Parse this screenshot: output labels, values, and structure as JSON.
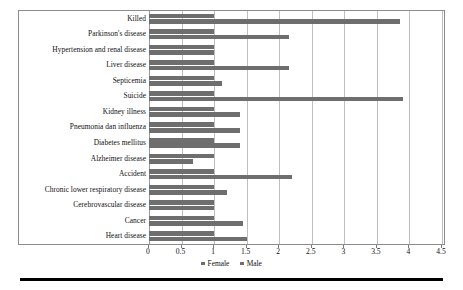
{
  "chart_data": {
    "type": "bar",
    "orientation": "horizontal",
    "title": "",
    "subtitle": "",
    "xlabel": "",
    "ylabel": "",
    "xlim": [
      0,
      4.5
    ],
    "ylim": null,
    "grid": true,
    "grid_axis": "x",
    "legend": {
      "position": "bottom-center",
      "entries": [
        {
          "name": "Female",
          "color": "#6e6e6e"
        },
        {
          "name": "Male",
          "color": "#6e6e6e"
        }
      ]
    },
    "xticks": [
      0,
      0.5,
      1,
      1.5,
      2,
      2.5,
      3,
      3.5,
      4,
      4.5
    ],
    "xtick_labels": [
      "0",
      "0.5",
      "1",
      "1.5",
      "2",
      "2.5",
      "3",
      "3.5",
      "4",
      "4.5"
    ],
    "categories": [
      "Killed",
      "Parkinson's disease",
      "Hypertension and renal disease",
      "Liver disease",
      "Septicemia",
      "Suicide",
      "Kidney illness",
      "Pneumonia dan influenza",
      "Diabetes mellitus",
      "Alzheimer disease",
      "Accident",
      "Chronic lower respiratory disease",
      "Cerebrovascular disease",
      "Cancer",
      "Heart disease"
    ],
    "series": [
      {
        "name": "Female",
        "color": "#6e6e6e",
        "values": [
          1.0,
          1.0,
          1.0,
          1.0,
          1.0,
          1.0,
          1.0,
          1.0,
          1.0,
          1.0,
          1.0,
          1.0,
          1.0,
          1.0,
          1.0
        ]
      },
      {
        "name": "Male",
        "color": "#6e6e6e",
        "values": [
          3.85,
          2.15,
          1.0,
          2.15,
          1.12,
          3.9,
          1.4,
          1.4,
          1.4,
          0.68,
          2.2,
          1.2,
          1.0,
          1.45,
          1.5
        ]
      }
    ]
  }
}
